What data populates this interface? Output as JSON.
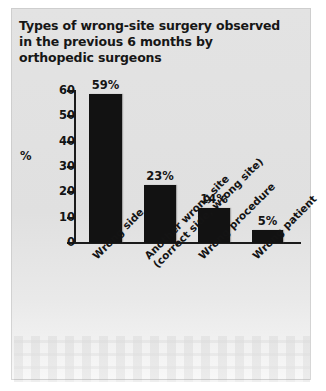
{
  "figure": {
    "title_lines": [
      "Types of wrong-site surgery observed",
      "in the previous 6 months by",
      "orthopedic surgeons"
    ],
    "y_axis_title": "%"
  },
  "chart_data": {
    "type": "bar",
    "title": "Types of wrong-site surgery observed in the previous 6 months by orthopedic surgeons",
    "xlabel": "",
    "ylabel": "%",
    "ylim": [
      0,
      60
    ],
    "yticks": [
      0,
      10,
      20,
      30,
      40,
      50,
      60
    ],
    "ytick_labels": [
      "0",
      "10",
      "20",
      "30",
      "40",
      "50",
      "60"
    ],
    "grid": false,
    "legend": false,
    "bar_color": "#121212",
    "categories": [
      "Wrong side",
      "Another wrong site (correct side, wrong site)",
      "Wrong procedure",
      "Wrong patient"
    ],
    "category_lines": [
      [
        "Wrong side"
      ],
      [
        "Another wrong site",
        "(correct side, wrong site)"
      ],
      [
        "Wrong procedure"
      ],
      [
        "Wrong patient"
      ]
    ],
    "values": [
      59,
      23,
      14,
      5
    ],
    "value_labels": [
      "59%",
      "23%",
      "14%",
      "5%"
    ]
  }
}
